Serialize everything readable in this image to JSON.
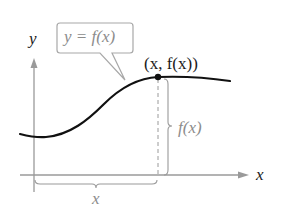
{
  "diagram": {
    "axes": {
      "x_label": "x",
      "y_label": "y"
    },
    "callout": {
      "label": "y = f(x)"
    },
    "point": {
      "label": "(x, f(x))"
    },
    "vertical_brace": {
      "label": "f(x)"
    },
    "horizontal_brace": {
      "label": "x"
    },
    "colors": {
      "curve": "#111111",
      "axes": "#9a9a9a",
      "annotations": "#8c8c8c",
      "background": "#ffffff"
    }
  }
}
